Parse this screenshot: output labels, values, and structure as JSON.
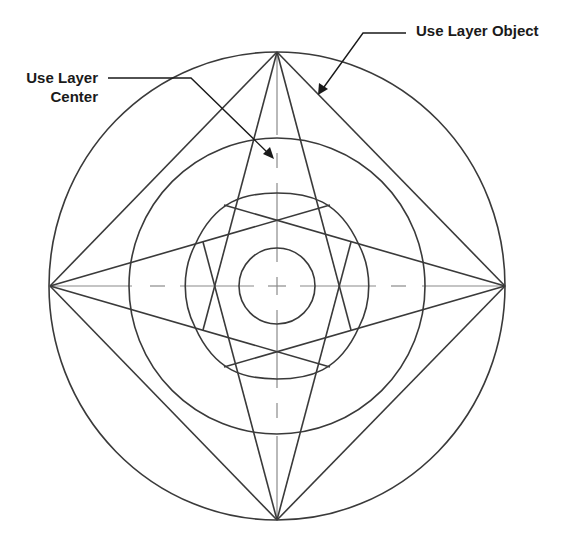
{
  "diagram": {
    "title": "",
    "labels": {
      "layer_center": {
        "line1": "Use Layer",
        "line2": "Center"
      },
      "layer_object": {
        "text": "Use Layer Object"
      }
    },
    "colors": {
      "stroke": "#3a3a3a",
      "centerline": "#8a8a8a",
      "text": "#1a1a1a",
      "background": "#ffffff"
    },
    "geometry": {
      "center": [
        277,
        286
      ],
      "outer_circle_radius": 228,
      "middle_circle_radius": 148,
      "inner_circle_radius": 92,
      "small_circle_radius": 38
    }
  }
}
